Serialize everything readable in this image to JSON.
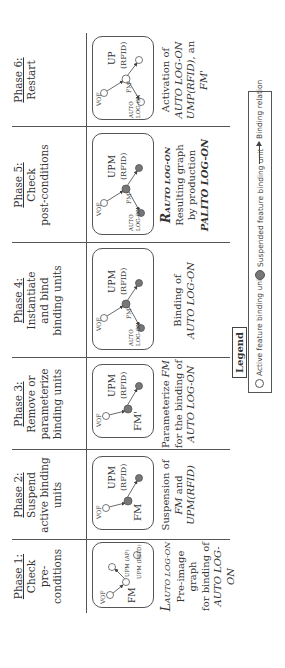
{
  "figure": {
    "phases": [
      {
        "id": 1,
        "title": "Phase 1:",
        "subtitle_lines": [
          "Check",
          "pre-conditions"
        ],
        "graph": {
          "nodes": [
            {
              "label": "VOF",
              "state": "active"
            },
            {
              "label": "FM",
              "state": "active"
            },
            {
              "label": "UPM (AP)",
              "state": "active"
            },
            {
              "label": "UPM (RFID)",
              "state": "active"
            }
          ],
          "edges": [
            [
              "VOF",
              "FM"
            ],
            [
              "FM",
              "UPM (RFID)"
            ]
          ]
        },
        "description": {
          "symbol": "L",
          "symbol_subscript": "AUTO LOG-ON",
          "lines": [
            "Pre-image graph",
            "for binding of"
          ],
          "italic_line": "AUTO LOG-ON"
        }
      },
      {
        "id": 2,
        "title": "Phase 2:",
        "subtitle_lines": [
          "Suspend",
          "active binding",
          "units"
        ],
        "graph": {
          "nodes": [
            {
              "label": "VOF",
              "state": "active"
            },
            {
              "label": "FM",
              "state": "suspended"
            },
            {
              "label": "UPM (RFID)",
              "state": "suspended"
            }
          ],
          "edges": [
            [
              "VOF",
              "FM"
            ],
            [
              "FM",
              "UPM (RFID)"
            ]
          ]
        },
        "description": {
          "line1": "Suspension of",
          "line2_italic": "FM",
          "line2_rest": " and",
          "line3_italic": "UPM(RFID)"
        }
      },
      {
        "id": 3,
        "title": "Phase 3:",
        "subtitle_lines": [
          "Remove or",
          "parameterize",
          "binding units"
        ],
        "graph": {
          "nodes": [
            {
              "label": "VOF",
              "state": "active"
            },
            {
              "label": "FM'",
              "state": "suspended"
            },
            {
              "label": "UPM (RFID)",
              "state": "suspended"
            }
          ],
          "edges": [
            [
              "VOF",
              "FM'"
            ],
            [
              "FM'",
              "UPM (RFID)"
            ]
          ]
        },
        "description": {
          "line1_plain": "Parameterize ",
          "line1_italic": "FM",
          "line2": "for the binding of",
          "line3_italic": "AUTO LOG-ON"
        }
      },
      {
        "id": 4,
        "title": "Phase 4:",
        "subtitle_lines": [
          "Instantiate",
          "and bind",
          "binding units"
        ],
        "graph": {
          "nodes": [
            {
              "label": "VOF",
              "state": "active"
            },
            {
              "label": "FM'",
              "state": "suspended"
            },
            {
              "label": "UPM (RFID)",
              "state": "suspended"
            },
            {
              "label": "AUTO LOG-ON",
              "state": "suspended"
            }
          ],
          "edges": [
            [
              "VOF",
              "FM'"
            ],
            [
              "FM'",
              "UPM (RFID)"
            ],
            [
              "FM'",
              "AUTO LOG-ON"
            ]
          ]
        },
        "description": {
          "line1": "Binding of",
          "line2_italic": "AUTO LOG-ON"
        }
      },
      {
        "id": 5,
        "title": "Phase 5:",
        "subtitle_lines": [
          "Check",
          "post-conditions"
        ],
        "graph": {
          "nodes": [
            {
              "label": "VOF",
              "state": "active"
            },
            {
              "label": "FM'",
              "state": "suspended"
            },
            {
              "label": "UPM (RFID)",
              "state": "suspended"
            },
            {
              "label": "AUTO LOG-ON",
              "state": "suspended"
            }
          ],
          "edges": [
            [
              "VOF",
              "FM'"
            ],
            [
              "FM'",
              "UPM (RFID)"
            ],
            [
              "FM'",
              "AUTO LOG-ON"
            ]
          ]
        },
        "description": {
          "symbol": "R",
          "symbol_subscript": "AUTO LOG-ON",
          "lines": [
            "Resulting graph",
            "by production"
          ],
          "bold_line": "PALITO LOG-ON"
        }
      },
      {
        "id": 6,
        "title": "Phase 6:",
        "subtitle_lines": [
          "Restart"
        ],
        "graph": {
          "nodes": [
            {
              "label": "VOF",
              "state": "active"
            },
            {
              "label": "FM'",
              "state": "active"
            },
            {
              "label": "UP (RFID)",
              "state": "active"
            },
            {
              "label": "AUTO LOG-ON",
              "state": "active"
            }
          ],
          "edges": [
            [
              "VOF",
              "FM'"
            ],
            [
              "FM'",
              "UP (RFID)"
            ],
            [
              "FM'",
              "AUTO LOG-ON"
            ]
          ]
        },
        "description": {
          "line1": "Activation of",
          "line2_italic": "AUTO LOG-ON",
          "line3_italic": "UMP(RFID)",
          "line3_rest": ", an",
          "line4_italic": "FM'"
        }
      }
    ],
    "legend": {
      "title": "Legend",
      "items": [
        {
          "icon": "active-node-icon",
          "label": "Active feature binding unit"
        },
        {
          "icon": "suspended-node-icon",
          "label": "Suspended feature binding unit"
        },
        {
          "icon": "arrow-icon",
          "label": "Binding relation"
        }
      ]
    },
    "colors": {
      "line": "#555555",
      "suspended_fill": "#777777",
      "active_fill": "#ffffff",
      "text": "#333333"
    }
  }
}
